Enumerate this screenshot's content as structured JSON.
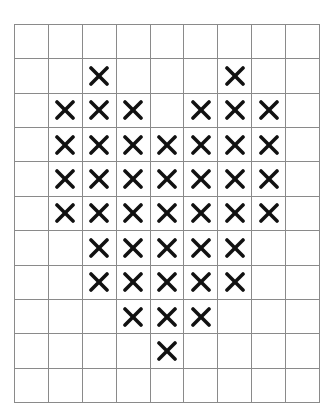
{
  "grid": {
    "rows": 11,
    "cols": 9,
    "line_color": "#8a8a8a",
    "mark_color": "#111111",
    "mark_symbol": "x-icon",
    "pattern": [
      [
        0,
        0,
        0,
        0,
        0,
        0,
        0,
        0,
        0
      ],
      [
        0,
        0,
        1,
        0,
        0,
        0,
        1,
        0,
        0
      ],
      [
        0,
        1,
        1,
        1,
        0,
        1,
        1,
        1,
        0
      ],
      [
        0,
        1,
        1,
        1,
        1,
        1,
        1,
        1,
        0
      ],
      [
        0,
        1,
        1,
        1,
        1,
        1,
        1,
        1,
        0
      ],
      [
        0,
        1,
        1,
        1,
        1,
        1,
        1,
        1,
        0
      ],
      [
        0,
        0,
        1,
        1,
        1,
        1,
        1,
        0,
        0
      ],
      [
        0,
        0,
        1,
        1,
        1,
        1,
        1,
        0,
        0
      ],
      [
        0,
        0,
        0,
        1,
        1,
        1,
        0,
        0,
        0
      ],
      [
        0,
        0,
        0,
        0,
        1,
        0,
        0,
        0,
        0
      ],
      [
        0,
        0,
        0,
        0,
        0,
        0,
        0,
        0,
        0
      ]
    ],
    "marked_count": 41,
    "shape": "heart"
  }
}
